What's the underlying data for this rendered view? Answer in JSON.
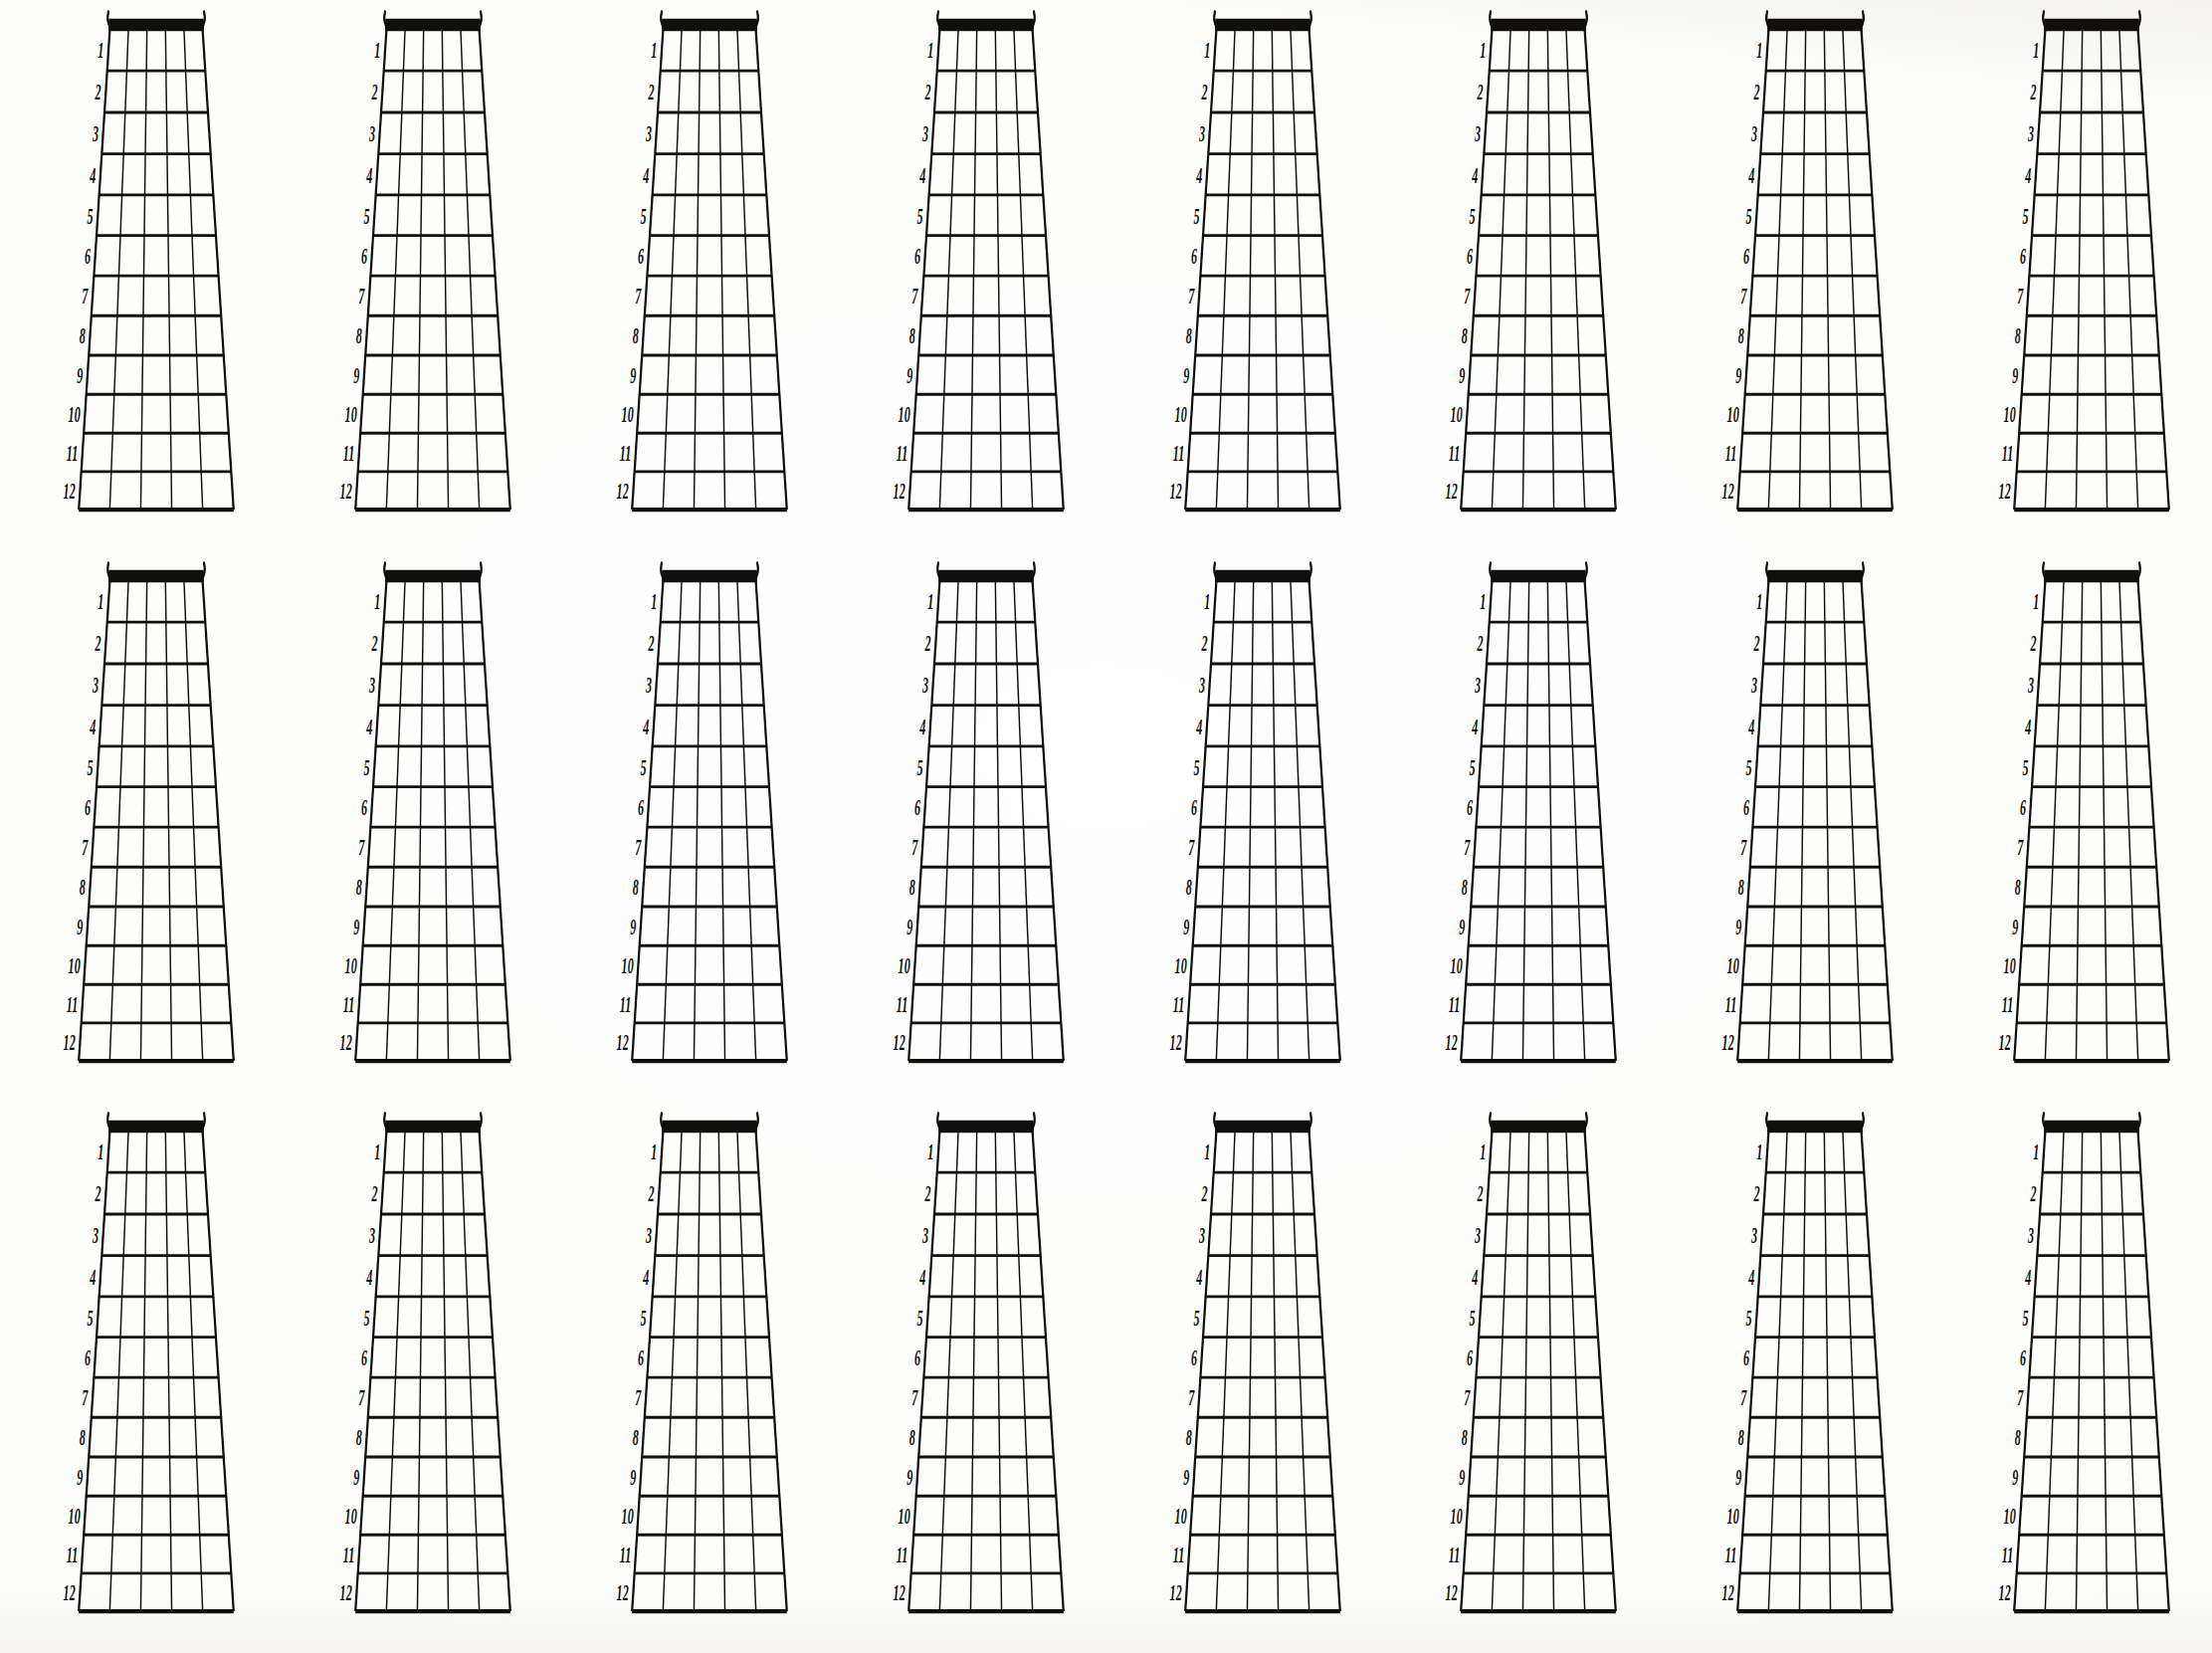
{
  "page": {
    "background_color": "#fbfbf8",
    "ink_color": "#100f0d",
    "width": 2223,
    "height": 1661
  },
  "sheet": {
    "rows": 3,
    "columns": 8,
    "total_diagrams": 24,
    "diagram_type": "blank-guitar-neck-12-fret"
  },
  "diagram": {
    "name": "guitar-fretboard",
    "strings": 6,
    "string_gaps": 5,
    "frets": 12,
    "nut": {
      "name": "nut",
      "style": "thick-black-bar-with-thin-line-above",
      "has_headstock_hooks": true
    },
    "fret_numbers": [
      "1",
      "2",
      "3",
      "4",
      "5",
      "6",
      "7",
      "8",
      "9",
      "10",
      "11",
      "12"
    ],
    "geometry": {
      "top_half_width": 0.335,
      "bottom_half_width": 0.56,
      "nut_y": 0.052,
      "bottom_y": 0.925,
      "center_x": 0.565,
      "hook_height": 0.03
    }
  },
  "chart_data": {
    "type": "table",
    "categories": [
      "row 1",
      "row 2",
      "row 3"
    ],
    "values": [
      8,
      8,
      8
    ],
    "xlabel": "",
    "ylabel": "diagrams per row",
    "grid": true,
    "legend": "none",
    "fret_labels": [
      "1",
      "2",
      "3",
      "4",
      "5",
      "6",
      "7",
      "8",
      "9",
      "10",
      "11",
      "12"
    ],
    "string_count": 6,
    "fret_count": 12
  }
}
